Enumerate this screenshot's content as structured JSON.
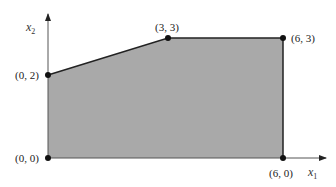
{
  "diagram": {
    "type": "feasible-region",
    "fill_color": "#a9a9a9",
    "edge_color": "#222222",
    "axes": {
      "x_label": "x",
      "x_subscript": "1",
      "y_label": "x",
      "y_subscript": "2"
    },
    "vertices": [
      {
        "label": "(0, 0)",
        "x": 0,
        "y": 0
      },
      {
        "label": "(0, 2)",
        "x": 0,
        "y": 2
      },
      {
        "label": "(3, 3)",
        "x": 3,
        "y": 3
      },
      {
        "label": "(6, 3)",
        "x": 6,
        "y": 3
      },
      {
        "label": "(6, 0)",
        "x": 6,
        "y": 0
      }
    ]
  }
}
